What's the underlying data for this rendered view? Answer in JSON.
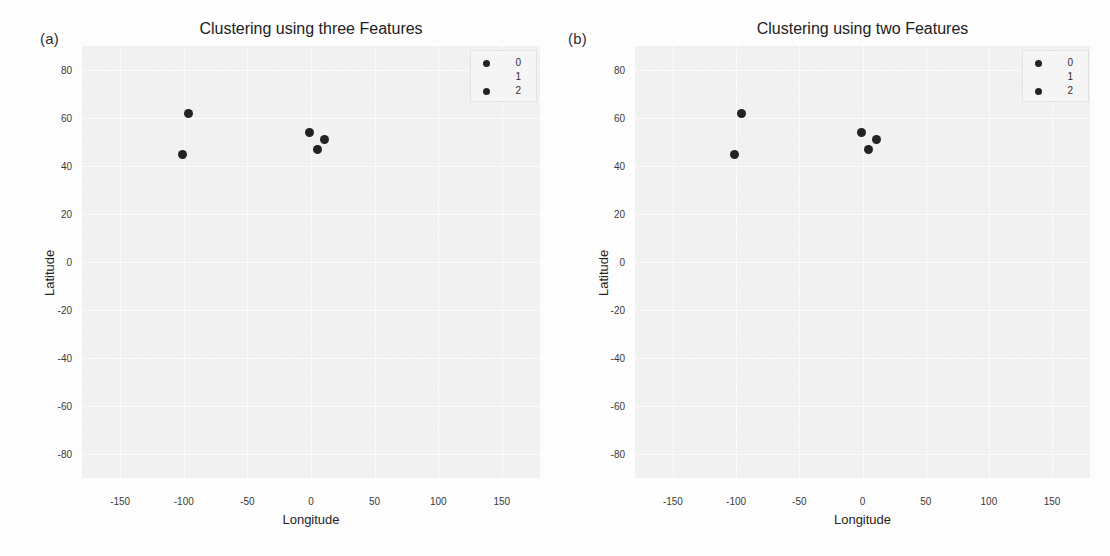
{
  "figure": {
    "panels": [
      {
        "tag": "(a)",
        "title": "Clustering using three Features",
        "xlabel": "Longitude",
        "ylabel": "Latitude"
      },
      {
        "tag": "(b)",
        "title": "Clustering using two Features",
        "xlabel": "Longitude",
        "ylabel": "Latitude"
      }
    ],
    "legend_labels": [
      "0",
      "1",
      "2"
    ],
    "colors": {
      "cluster_0": "#232323",
      "cluster_1": "#f4f4f4",
      "cluster_2": "#232323",
      "plot_background": "#f1f1f1",
      "grid": "#fbfbfb",
      "page_background": "#fdfdfd"
    }
  },
  "chart_data": [
    {
      "type": "scatter",
      "title": "Clustering using three Features",
      "xlabel": "Longitude",
      "ylabel": "Latitude",
      "xlim": [
        -180,
        180
      ],
      "ylim": [
        -90,
        90
      ],
      "xticks": [
        -150,
        -100,
        -50,
        0,
        50,
        100,
        150
      ],
      "yticks": [
        80,
        60,
        40,
        20,
        0,
        -20,
        -40,
        -60,
        -80
      ],
      "grid": true,
      "legend_position": "upper right",
      "series": [
        {
          "name": "0",
          "color": "#232323",
          "points": [
            {
              "x": -96,
              "y": 62
            },
            {
              "x": -101,
              "y": 45
            }
          ]
        },
        {
          "name": "1",
          "color": "#f4f4f4",
          "points": []
        },
        {
          "name": "2",
          "color": "#232323",
          "points": [
            {
              "x": -1,
              "y": 54
            },
            {
              "x": 11,
              "y": 51
            },
            {
              "x": 5,
              "y": 47
            }
          ]
        }
      ]
    },
    {
      "type": "scatter",
      "title": "Clustering using two Features",
      "xlabel": "Longitude",
      "ylabel": "Latitude",
      "xlim": [
        -180,
        180
      ],
      "ylim": [
        -90,
        90
      ],
      "xticks": [
        -150,
        -100,
        -50,
        0,
        50,
        100,
        150
      ],
      "yticks": [
        80,
        60,
        40,
        20,
        0,
        -20,
        -40,
        -60,
        -80
      ],
      "grid": true,
      "legend_position": "upper right",
      "series": [
        {
          "name": "0",
          "color": "#232323",
          "points": [
            {
              "x": -96,
              "y": 62
            },
            {
              "x": -101,
              "y": 45
            }
          ]
        },
        {
          "name": "1",
          "color": "#f4f4f4",
          "points": []
        },
        {
          "name": "2",
          "color": "#232323",
          "points": [
            {
              "x": -1,
              "y": 54
            },
            {
              "x": 11,
              "y": 51
            },
            {
              "x": 5,
              "y": 47
            }
          ]
        }
      ]
    }
  ]
}
